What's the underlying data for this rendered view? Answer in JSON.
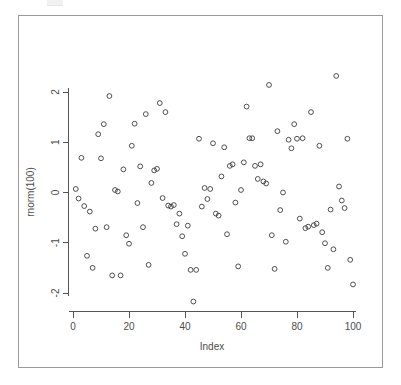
{
  "window": {
    "background_color": "#ffffff",
    "frame_color": "#9a9a9a"
  },
  "chart_data": {
    "type": "scatter",
    "title": "",
    "subtitle": "",
    "xlabel": "Index",
    "ylabel": "rnorm(100)",
    "xlim": [
      0,
      101
    ],
    "ylim": [
      -2.2,
      2.35
    ],
    "xticks": [
      0,
      20,
      40,
      60,
      80,
      100
    ],
    "xtick_labels": [
      "0",
      "20",
      "40",
      "60",
      "80",
      "100"
    ],
    "yticks": [
      -2,
      -1,
      0,
      1,
      2
    ],
    "ytick_labels": [
      "-2",
      "-1",
      "0",
      "1",
      "2"
    ],
    "grid": false,
    "legend": null,
    "marker": "open-circle",
    "marker_color": "#3d3d3d",
    "n_points": 100,
    "x": [
      1,
      2,
      3,
      4,
      5,
      6,
      7,
      8,
      9,
      10,
      11,
      12,
      13,
      14,
      15,
      16,
      17,
      18,
      19,
      20,
      21,
      22,
      23,
      24,
      25,
      26,
      27,
      28,
      29,
      30,
      31,
      32,
      33,
      34,
      35,
      36,
      37,
      38,
      39,
      40,
      41,
      42,
      43,
      44,
      45,
      46,
      47,
      48,
      49,
      50,
      51,
      52,
      53,
      54,
      55,
      56,
      57,
      58,
      59,
      60,
      61,
      62,
      63,
      64,
      65,
      66,
      67,
      68,
      69,
      70,
      71,
      72,
      73,
      74,
      75,
      76,
      77,
      78,
      79,
      80,
      81,
      82,
      83,
      84,
      85,
      86,
      87,
      88,
      89,
      90,
      91,
      92,
      93,
      94,
      95,
      96,
      97,
      98,
      99,
      100
    ],
    "y": [
      0.07,
      -0.12,
      0.69,
      -0.27,
      -1.26,
      -0.38,
      -1.5,
      -0.72,
      1.16,
      0.68,
      1.36,
      -0.69,
      1.92,
      -1.65,
      0.05,
      0.02,
      -1.65,
      0.46,
      -0.85,
      -1.02,
      0.93,
      1.37,
      -0.21,
      0.52,
      -0.69,
      1.56,
      -1.44,
      0.19,
      0.44,
      0.47,
      1.78,
      -0.11,
      1.6,
      -0.26,
      -0.28,
      -0.25,
      -0.63,
      -0.42,
      -0.87,
      -1.22,
      -0.66,
      -1.54,
      -2.17,
      -1.54,
      1.07,
      -0.28,
      0.09,
      -0.13,
      0.07,
      0.98,
      -0.42,
      -0.46,
      0.32,
      0.9,
      -0.83,
      0.53,
      0.56,
      -0.2,
      -1.47,
      0.05,
      0.6,
      1.71,
      1.08,
      1.08,
      0.53,
      0.27,
      0.56,
      0.22,
      0.18,
      2.14,
      -0.85,
      -1.52,
      1.22,
      -0.35,
      0.0,
      -0.98,
      1.05,
      0.88,
      1.36,
      1.07,
      -0.52,
      1.08,
      -0.71,
      -0.68,
      1.6,
      -0.65,
      -0.62,
      0.93,
      -0.79,
      -1.01,
      -1.5,
      -0.34,
      -1.13,
      2.32,
      0.12,
      -0.16,
      -0.31,
      1.07,
      -1.34,
      -1.83
    ]
  },
  "axes": {
    "x_axis_label": "Index",
    "y_axis_label": "rnorm(100)"
  }
}
